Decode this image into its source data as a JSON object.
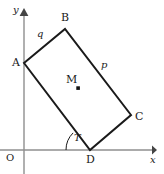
{
  "figure": {
    "width": 164,
    "height": 174,
    "background_color": "#ffffff",
    "stroke_color": "#1a1a1a",
    "axis_color": "#8f8f8f"
  },
  "axes": {
    "x_label": "x",
    "y_label": "y",
    "origin_label": "O",
    "x_axis": {
      "y": 150,
      "x_start": 0,
      "x_end": 156
    },
    "y_axis": {
      "x": 24,
      "y_start": 10,
      "y_end": 174
    }
  },
  "shape": {
    "type": "rectangle",
    "vertices": [
      {
        "name": "A",
        "x": 24,
        "y": 63
      },
      {
        "name": "B",
        "x": 65,
        "y": 29
      },
      {
        "name": "C",
        "x": 131,
        "y": 115
      },
      {
        "name": "D",
        "x": 90,
        "y": 150
      }
    ],
    "vertex_labels": [
      {
        "label": "A",
        "x": 12,
        "y": 57
      },
      {
        "label": "B",
        "x": 61,
        "y": 12
      },
      {
        "label": "C",
        "x": 135,
        "y": 111
      },
      {
        "label": "D",
        "x": 86,
        "y": 154
      }
    ],
    "centre": {
      "label": "M",
      "x": 66,
      "y": 74,
      "dot_x": 78,
      "dot_y": 88
    },
    "side_labels": [
      {
        "label": "q",
        "x": 37,
        "y": 29,
        "side": "A-B"
      },
      {
        "label": "p",
        "x": 101,
        "y": 60,
        "side": "B-C"
      }
    ]
  },
  "angle": {
    "label": "T",
    "label_x": 74,
    "label_y": 133,
    "vertex": "D",
    "arc_radius": 24
  }
}
